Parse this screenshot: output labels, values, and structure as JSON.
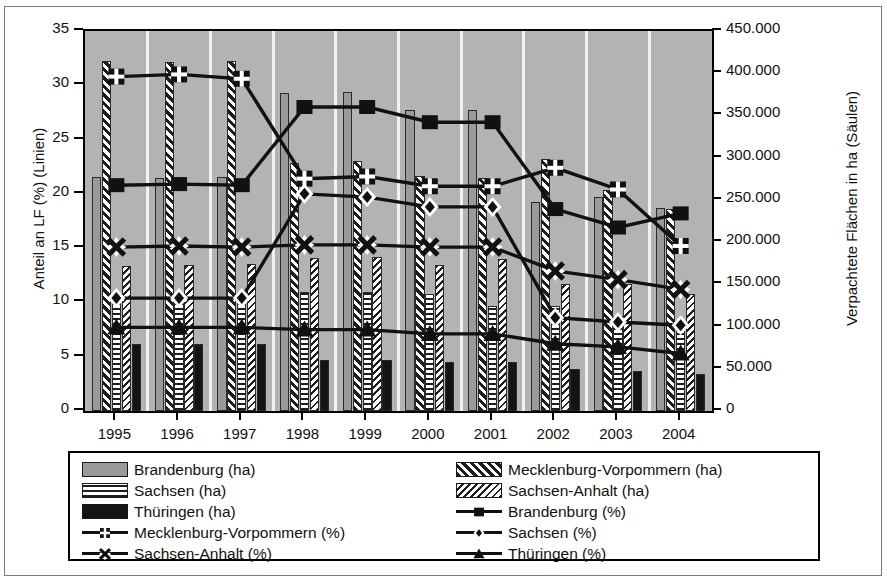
{
  "chart_data": {
    "type": "bar",
    "title": "",
    "xlabel": "",
    "ylabel": "Anteil an LF (%) (Linien)",
    "ylabel_right": "Verpachtete Flächen in ha (Säulen)",
    "categories": [
      "1995",
      "1996",
      "1997",
      "1998",
      "1999",
      "2000",
      "2001",
      "2002",
      "2003",
      "2004"
    ],
    "ylim": [
      0,
      35
    ],
    "yticks": [
      "0",
      "5",
      "10",
      "15",
      "20",
      "25",
      "30",
      "35"
    ],
    "ylim_right": [
      0,
      450000
    ],
    "yticks_right": [
      "0",
      "50.000",
      "100.000",
      "150.000",
      "200.000",
      "250.000",
      "300.000",
      "350.000",
      "400.000",
      "450.000"
    ],
    "grid": true,
    "legend_position": "bottom",
    "bar_series": [
      {
        "name": "Brandenburg (ha)",
        "pattern": "solid-gray",
        "values": [
          277000,
          276000,
          277000,
          377000,
          378000,
          357000,
          357000,
          248000,
          253000,
          240000
        ]
      },
      {
        "name": "Mecklenburg-Vorpommern (ha)",
        "pattern": "diagonal-hatch",
        "values": [
          414000,
          413000,
          415000,
          294000,
          296000,
          278000,
          276000,
          298000,
          262000,
          239000
        ]
      },
      {
        "name": "Sachsen (ha)",
        "pattern": "horizontal-lines",
        "values": [
          137000,
          137000,
          136000,
          141000,
          141000,
          138000,
          124000,
          124000,
          112000,
          106000
        ]
      },
      {
        "name": "Sachsen-Anhalt (ha)",
        "pattern": "dense-diagonal",
        "values": [
          172000,
          173000,
          174000,
          181000,
          182000,
          173000,
          180000,
          151000,
          150000,
          139000
        ]
      },
      {
        "name": "Thüringen (ha)",
        "pattern": "solid-black",
        "values": [
          79000,
          79000,
          79000,
          60000,
          60000,
          58000,
          58000,
          50000,
          47000,
          44000
        ]
      }
    ],
    "line_series": [
      {
        "name": "Brandenburg (%)",
        "marker": "square",
        "values": [
          20.8,
          20.9,
          20.8,
          28.0,
          28.0,
          26.6,
          26.6,
          18.6,
          16.9,
          18.2
        ]
      },
      {
        "name": "Mecklenburg-Vorpommern (%)",
        "marker": "plus-square",
        "values": [
          30.8,
          31.0,
          30.6,
          21.4,
          21.6,
          20.7,
          20.7,
          22.4,
          20.4,
          15.2
        ]
      },
      {
        "name": "Sachsen (%)",
        "marker": "diamond",
        "values": [
          10.4,
          10.4,
          10.4,
          20.0,
          19.7,
          18.8,
          18.8,
          8.6,
          8.2,
          7.9
        ]
      },
      {
        "name": "Sachsen-Anhalt (%)",
        "marker": "star-x",
        "values": [
          15.1,
          15.2,
          15.1,
          15.3,
          15.3,
          15.1,
          15.1,
          12.9,
          12.1,
          11.2
        ]
      },
      {
        "name": "Thüringen (%)",
        "marker": "triangle",
        "values": [
          7.7,
          7.7,
          7.7,
          7.5,
          7.5,
          7.1,
          7.1,
          6.2,
          5.9,
          5.3
        ]
      }
    ]
  },
  "legend": {
    "column_left": [
      {
        "label": "Brandenburg (ha)",
        "kind": "swatch",
        "pattern": "solid-gray"
      },
      {
        "label": "Sachsen (ha)",
        "kind": "swatch",
        "pattern": "horizontal-lines"
      },
      {
        "label": "Thüringen (ha)",
        "kind": "swatch",
        "pattern": "solid-black"
      },
      {
        "label": "Mecklenburg-Vorpommern (%)",
        "kind": "line",
        "marker": "plus-square"
      },
      {
        "label": "Sachsen-Anhalt (%)",
        "kind": "line",
        "marker": "star-x"
      }
    ],
    "column_right": [
      {
        "label": "Mecklenburg-Vorpommern (ha)",
        "kind": "swatch",
        "pattern": "diagonal-hatch"
      },
      {
        "label": "Sachsen-Anhalt (ha)",
        "kind": "swatch",
        "pattern": "dense-diagonal"
      },
      {
        "label": "Brandenburg (%)",
        "kind": "line",
        "marker": "square"
      },
      {
        "label": "Sachsen (%)",
        "kind": "line",
        "marker": "diamond"
      },
      {
        "label": "Thüringen (%)",
        "kind": "line",
        "marker": "triangle"
      }
    ]
  },
  "colors": {
    "plot_background": "#b3b3b3",
    "gridline": "#f2f2f2",
    "axis": "#000000",
    "bar_brandenburg": "#9a9a9a",
    "bar_thueringen": "#141414",
    "line": "#111111",
    "page_background": "#ffffff"
  }
}
